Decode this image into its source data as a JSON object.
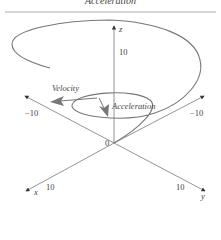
{
  "title": "Acceleration",
  "axes": {
    "z_label": "z",
    "x_label": "x",
    "y_label": "y",
    "z_tick": "10",
    "origin": "0",
    "x_neg_tick": "−10",
    "y_neg_tick": "−10",
    "x_pos_tick": "10",
    "y_pos_tick": "10"
  },
  "annotations": {
    "velocity": "Velocity",
    "acceleration": "Acceleration"
  },
  "colors": {
    "curve": "#777777",
    "axis": "#555555",
    "arrow": "#666666"
  }
}
